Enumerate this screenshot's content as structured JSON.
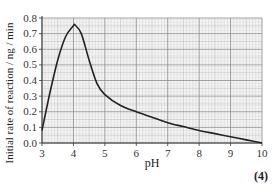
{
  "chart_data": {
    "type": "line",
    "title": "",
    "xlabel": "pH",
    "ylabel": "Initial rate of reaction / ng / min",
    "xlim": [
      3,
      10
    ],
    "ylim": [
      0.0,
      0.8
    ],
    "xticks": [
      "3",
      "4",
      "5",
      "6",
      "7",
      "8",
      "9",
      "10"
    ],
    "yticks": [
      "0.0",
      "0.1",
      "0.2",
      "0.3",
      "0.4",
      "0.5",
      "0.6",
      "0.7",
      "0.8"
    ],
    "grid": true,
    "legend": null,
    "series": [
      {
        "name": "Initial rate of reaction",
        "x": [
          3.0,
          3.25,
          3.5,
          3.75,
          4.0,
          4.05,
          4.25,
          4.5,
          4.75,
          5.0,
          5.5,
          6.0,
          6.5,
          7.0,
          7.5,
          8.0,
          8.5,
          9.0,
          9.5,
          10.0
        ],
        "y": [
          0.08,
          0.32,
          0.53,
          0.68,
          0.75,
          0.755,
          0.7,
          0.53,
          0.38,
          0.31,
          0.24,
          0.2,
          0.165,
          0.13,
          0.105,
          0.08,
          0.06,
          0.04,
          0.02,
          0.0
        ]
      }
    ]
  },
  "labels": {
    "ylabel": "Initial rate of reaction / ng / min",
    "xlabel": "pH",
    "marks": "(4)"
  }
}
